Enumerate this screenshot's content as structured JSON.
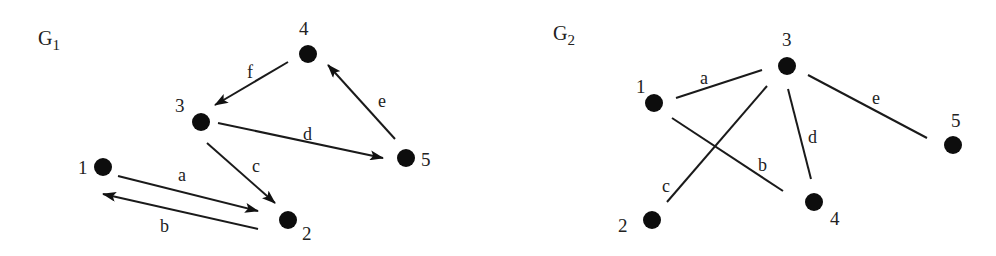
{
  "graphs": [
    {
      "id": "G1",
      "title_main": "G",
      "title_sub": "1",
      "type": "directed",
      "title_pos": [
        38,
        45
      ],
      "nodes": [
        {
          "id": "1",
          "x": 103,
          "y": 167,
          "lx": 78,
          "ly": 174
        },
        {
          "id": "2",
          "x": 288,
          "y": 220,
          "lx": 302,
          "ly": 240
        },
        {
          "id": "3",
          "x": 201,
          "y": 122,
          "lx": 175,
          "ly": 112
        },
        {
          "id": "4",
          "x": 308,
          "y": 54,
          "lx": 299,
          "ly": 35
        },
        {
          "id": "5",
          "x": 406,
          "y": 158,
          "lx": 421,
          "ly": 166
        }
      ],
      "edges": [
        {
          "label": "a",
          "from": [
            118,
            176
          ],
          "to": [
            258,
            211
          ],
          "arrow": "end",
          "lx": 178,
          "ly": 181
        },
        {
          "label": "b",
          "from": [
            258,
            229
          ],
          "to": [
            103,
            194
          ],
          "arrow": "end",
          "lx": 160,
          "ly": 232
        },
        {
          "label": "c",
          "from": [
            207,
            143
          ],
          "to": [
            275,
            203
          ],
          "arrow": "end",
          "lx": 252,
          "ly": 172
        },
        {
          "label": "d",
          "from": [
            218,
            123
          ],
          "to": [
            383,
            158
          ],
          "arrow": "end",
          "lx": 303,
          "ly": 140
        },
        {
          "label": "e",
          "from": [
            395,
            139
          ],
          "to": [
            328,
            65
          ],
          "arrow": "end",
          "lx": 378,
          "ly": 107
        },
        {
          "label": "f",
          "from": [
            288,
            62
          ],
          "to": [
            215,
            105
          ],
          "arrow": "end",
          "lx": 247,
          "ly": 78
        }
      ]
    },
    {
      "id": "G2",
      "title_main": "G",
      "title_sub": "2",
      "type": "undirected",
      "title_pos": [
        553,
        40
      ],
      "nodes": [
        {
          "id": "1",
          "x": 654,
          "y": 103,
          "lx": 636,
          "ly": 93
        },
        {
          "id": "2",
          "x": 652,
          "y": 220,
          "lx": 618,
          "ly": 232
        },
        {
          "id": "3",
          "x": 787,
          "y": 66,
          "lx": 782,
          "ly": 46
        },
        {
          "id": "4",
          "x": 814,
          "y": 202,
          "lx": 830,
          "ly": 225
        },
        {
          "id": "5",
          "x": 953,
          "y": 145,
          "lx": 951,
          "ly": 127
        }
      ],
      "edges": [
        {
          "label": "a",
          "from": [
            676,
            98
          ],
          "to": [
            762,
            70
          ],
          "lx": 700,
          "ly": 84
        },
        {
          "label": "b",
          "from": [
            672,
            118
          ],
          "to": [
            783,
            191
          ],
          "lx": 758,
          "ly": 171
        },
        {
          "label": "c",
          "from": [
            667,
            202
          ],
          "to": [
            767,
            86
          ],
          "lx": 662,
          "ly": 192
        },
        {
          "label": "d",
          "from": [
            788,
            89
          ],
          "to": [
            811,
            179
          ],
          "lx": 808,
          "ly": 143
        },
        {
          "label": "e",
          "from": [
            808,
            75
          ],
          "to": [
            927,
            138
          ],
          "lx": 872,
          "ly": 104
        }
      ]
    }
  ]
}
